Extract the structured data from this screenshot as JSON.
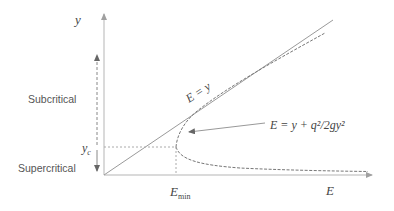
{
  "diagram": {
    "axes": {
      "y_label": "y",
      "x_label": "E"
    },
    "regions": {
      "subcritical": "Subcritical",
      "supercritical": "Supercritical"
    },
    "labels": {
      "line_label": "E = y",
      "curve_formula": "E = y + q²/2gy²",
      "critical_depth": "y",
      "critical_depth_sub": "c",
      "min_energy": "E",
      "min_energy_sub": "min"
    },
    "colors": {
      "line": "#9a9a9a",
      "curve": "#777777",
      "text": "#444444"
    }
  }
}
